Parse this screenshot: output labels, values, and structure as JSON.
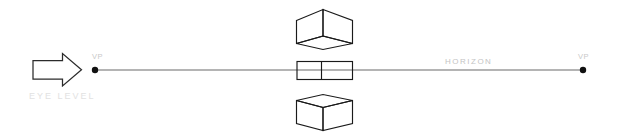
{
  "diagram": {
    "background_color": "#ffffff",
    "line_color": "#1a1a1a",
    "horizon_line_color": "#6b6b6b",
    "labels": {
      "vp_left": "VP",
      "vp_right": "VP",
      "horizon": "HORIZON",
      "eye_level": "EYE LEVEL"
    },
    "label_colors": {
      "vp": "#c9c9c9",
      "horizon": "#c4c4c4",
      "eye_level": "#e2e2e2"
    },
    "icons": {
      "eye_level_arrow": "right-arrow-outline",
      "vp_left_marker": "vanishing-point-dot",
      "vp_right_marker": "vanishing-point-dot"
    },
    "horizon": {
      "y": 70,
      "x_start": 95,
      "x_end": 583
    },
    "vanishing_points": [
      {
        "name": "vp-left",
        "x": 95,
        "y": 70,
        "radius": 3.2
      },
      {
        "name": "vp-right",
        "x": 583,
        "y": 70,
        "radius": 3.2
      }
    ],
    "cubes": [
      {
        "name": "cube-above-eye-level",
        "position": "above",
        "description": "Cube seen from below; its bottom face is visible as a diamond.",
        "bounds": {
          "x": 296,
          "y": 9,
          "width": 57,
          "height": 40
        }
      },
      {
        "name": "cube-at-eye-level",
        "position": "at",
        "description": "Cube at eye level; seen edge-on so only the front and side rectangles read as flat bands.",
        "bounds": {
          "x": 297,
          "y": 61,
          "width": 56,
          "height": 19
        }
      },
      {
        "name": "cube-below-eye-level",
        "position": "below",
        "description": "Cube seen from above; its top face is visible as a diamond.",
        "bounds": {
          "x": 296,
          "y": 94,
          "width": 57,
          "height": 37
        }
      }
    ]
  }
}
